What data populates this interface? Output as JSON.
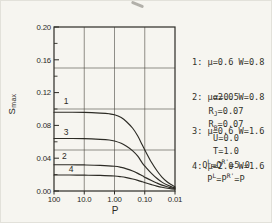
{
  "figure": {
    "background": "#f6f5f0",
    "ink": "#2c2b25",
    "grid_ink": "#4a4940"
  },
  "chart_data": {
    "type": "line",
    "title": "",
    "x_axis": {
      "label": "P",
      "scale": "log",
      "direction": "reversed",
      "min": 0.01,
      "max": 100,
      "ticks": [
        {
          "value": 100,
          "label": "100"
        },
        {
          "value": 10,
          "label": "10.0"
        },
        {
          "value": 1,
          "label": "1.00"
        },
        {
          "value": 0.1,
          "label": "0.10"
        },
        {
          "value": 0.01,
          "label": "0.01"
        }
      ],
      "gridlines": [
        10,
        1,
        0.1
      ]
    },
    "y_axis": {
      "label": "Smax",
      "label_main": "S",
      "label_sub": "max",
      "min": 0,
      "max": 0.2,
      "ticks": [
        {
          "value": 0.0,
          "label": "0.00"
        },
        {
          "value": 0.04,
          "label": "0.04"
        },
        {
          "value": 0.08,
          "label": "0.08"
        },
        {
          "value": 0.12,
          "label": "0.12"
        },
        {
          "value": 0.16,
          "label": "0.16"
        },
        {
          "value": 0.2,
          "label": "0.20"
        }
      ],
      "minor_ticks": [
        0.02,
        0.06,
        0.1,
        0.14,
        0.18
      ],
      "gridlines": [
        0.05,
        0.1,
        0.15
      ]
    },
    "series": [
      {
        "name": "1",
        "legend": "1: μ=0.6 W=0.8",
        "label_at": {
          "P": 40,
          "S": 0.109
        },
        "points": [
          [
            100,
            0.096
          ],
          [
            30,
            0.096
          ],
          [
            10,
            0.0958
          ],
          [
            3,
            0.095
          ],
          [
            1.5,
            0.0942
          ],
          [
            1,
            0.093
          ],
          [
            0.6,
            0.0895
          ],
          [
            0.4,
            0.0845
          ],
          [
            0.25,
            0.0765
          ],
          [
            0.17,
            0.067
          ],
          [
            0.12,
            0.056
          ],
          [
            0.09,
            0.047
          ],
          [
            0.06,
            0.035
          ],
          [
            0.04,
            0.025
          ],
          [
            0.027,
            0.017
          ],
          [
            0.018,
            0.011
          ],
          [
            0.013,
            0.0075
          ],
          [
            0.01,
            0.005
          ]
        ]
      },
      {
        "name": "2",
        "legend": "2: μ=2.0 W=0.8",
        "label_at": {
          "P": 45,
          "S": 0.0425
        },
        "points": [
          [
            100,
            0.032
          ],
          [
            30,
            0.032
          ],
          [
            10,
            0.0318
          ],
          [
            3,
            0.0313
          ],
          [
            1,
            0.0302
          ],
          [
            0.6,
            0.0288
          ],
          [
            0.4,
            0.027
          ],
          [
            0.25,
            0.0243
          ],
          [
            0.17,
            0.0215
          ],
          [
            0.12,
            0.0185
          ],
          [
            0.09,
            0.016
          ],
          [
            0.06,
            0.0128
          ],
          [
            0.04,
            0.0098
          ],
          [
            0.027,
            0.0072
          ],
          [
            0.018,
            0.0052
          ],
          [
            0.013,
            0.0038
          ],
          [
            0.01,
            0.003
          ]
        ]
      },
      {
        "name": "3",
        "legend": "3: μ=0.6 W=1.6",
        "label_at": {
          "P": 40,
          "S": 0.0715
        },
        "points": [
          [
            100,
            0.064
          ],
          [
            30,
            0.064
          ],
          [
            10,
            0.0638
          ],
          [
            3,
            0.063
          ],
          [
            1.5,
            0.0622
          ],
          [
            1,
            0.061
          ],
          [
            0.6,
            0.0582
          ],
          [
            0.4,
            0.0545
          ],
          [
            0.25,
            0.049
          ],
          [
            0.17,
            0.0425
          ],
          [
            0.12,
            0.034
          ],
          [
            0.09,
            0.0285
          ],
          [
            0.06,
            0.0215
          ],
          [
            0.04,
            0.0155
          ],
          [
            0.027,
            0.0108
          ],
          [
            0.018,
            0.0072
          ],
          [
            0.013,
            0.0052
          ],
          [
            0.01,
            0.0038
          ]
        ]
      },
      {
        "name": "4",
        "legend": "4: μ=2.0 W=1.6",
        "label_at": {
          "P": 27,
          "S": 0.0265
        },
        "points": [
          [
            100,
            0.0195
          ],
          [
            30,
            0.0195
          ],
          [
            10,
            0.0193
          ],
          [
            3,
            0.019
          ],
          [
            1,
            0.0183
          ],
          [
            0.6,
            0.0174
          ],
          [
            0.4,
            0.0163
          ],
          [
            0.25,
            0.0147
          ],
          [
            0.17,
            0.013
          ],
          [
            0.12,
            0.0112
          ],
          [
            0.09,
            0.0097
          ],
          [
            0.06,
            0.0078
          ],
          [
            0.04,
            0.006
          ],
          [
            0.027,
            0.0045
          ],
          [
            0.018,
            0.0033
          ],
          [
            0.013,
            0.0026
          ],
          [
            0.01,
            0.0022
          ]
        ]
      }
    ]
  },
  "annotations": {
    "params": [
      {
        "segs": [
          {
            "t": "α=0.5"
          }
        ]
      },
      {
        "segs": [
          {
            "t": "R"
          },
          {
            "t": "J",
            "m": "sub"
          },
          {
            "t": "=0.07"
          }
        ]
      },
      {
        "segs": [
          {
            "t": "R"
          },
          {
            "t": "B",
            "m": "sub"
          },
          {
            "t": "=0.07"
          }
        ]
      },
      {
        "segs": [
          {
            "t": "U=0.0"
          }
        ]
      },
      {
        "segs": [
          {
            "t": "T=1.0"
          }
        ]
      },
      {
        "segs": [
          {
            "t": "Q"
          },
          {
            "t": "L",
            "m": "sup"
          },
          {
            "t": "=Q"
          },
          {
            "t": "R'",
            "m": "sup"
          },
          {
            "t": "=5.0"
          }
        ]
      },
      {
        "segs": [
          {
            "t": "P"
          },
          {
            "t": "L",
            "m": "sup"
          },
          {
            "t": "=P"
          },
          {
            "t": "R'",
            "m": "sup"
          },
          {
            "t": "=P"
          }
        ]
      }
    ]
  }
}
